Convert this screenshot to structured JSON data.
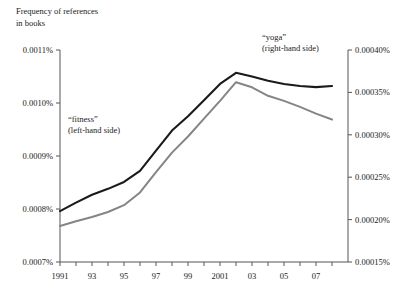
{
  "chart_data": {
    "type": "line",
    "title": "Frequency of references in books",
    "title_lines": [
      "Frequency of references",
      "in books"
    ],
    "xlabel": "",
    "ylabel": "",
    "grid": false,
    "legend_position": "inline-annotation",
    "x": [
      1991,
      1992,
      1993,
      1994,
      1995,
      1996,
      1997,
      1998,
      1999,
      2000,
      2001,
      2002,
      2003,
      2004,
      2005,
      2006,
      2007,
      2008
    ],
    "xtick_values": [
      1991,
      1993,
      1995,
      1997,
      1999,
      2001,
      2003,
      2005,
      2007
    ],
    "xtick_labels": [
      "1991",
      "93",
      "95",
      "97",
      "99",
      "2001",
      "03",
      "05",
      "07"
    ],
    "xlim": [
      1991,
      2009
    ],
    "left_axis": {
      "label_suffix": "%",
      "ylim": [
        0.0007,
        0.0011
      ],
      "ticks": [
        0.0007,
        0.0008,
        0.0009,
        0.001,
        0.0011
      ],
      "tick_labels": [
        "0.0007%",
        "0.0008%",
        "0.0009%",
        "0.0010%",
        "0.0011%"
      ]
    },
    "right_axis": {
      "label_suffix": "%",
      "ylim": [
        0.00015,
        0.0004
      ],
      "ticks": [
        0.00015,
        0.0002,
        0.00025,
        0.0003,
        0.00035,
        0.0004
      ],
      "tick_labels": [
        "0.00015%",
        "0.00020%",
        "0.00025%",
        "0.00030%",
        "0.00035%",
        "0.00040%"
      ]
    },
    "series": [
      {
        "name": "“fitness”",
        "annotation_lines": [
          "“fitness”",
          "(left-hand side)"
        ],
        "axis": "left",
        "color": "#1a1a1a",
        "values": [
          0.000796,
          0.000812,
          0.000827,
          0.000838,
          0.000851,
          0.000872,
          0.00091,
          0.000948,
          0.000975,
          0.001005,
          0.001036,
          0.001057,
          0.00105,
          0.001042,
          0.001036,
          0.001032,
          0.00103,
          0.001032
        ]
      },
      {
        "name": "“yoga”",
        "annotation_lines": [
          "“yoga”",
          "(right-hand side)"
        ],
        "axis": "right",
        "color": "#858585",
        "values": [
          0.0001925,
          0.000198,
          0.000203,
          0.000209,
          0.000217,
          0.000232,
          0.000256,
          0.000279,
          0.000298,
          0.000319,
          0.00034,
          0.000362,
          0.000356,
          0.000346,
          0.00034,
          0.000333,
          0.000325,
          0.000318
        ]
      }
    ]
  },
  "annotations": {
    "fitness_line1": "“fitness”",
    "fitness_line2": "(left-hand side)",
    "yoga_line1": "“yoga”",
    "yoga_line2": "(right-hand side)"
  },
  "title": {
    "line1": "Frequency of references",
    "line2": "in books"
  }
}
